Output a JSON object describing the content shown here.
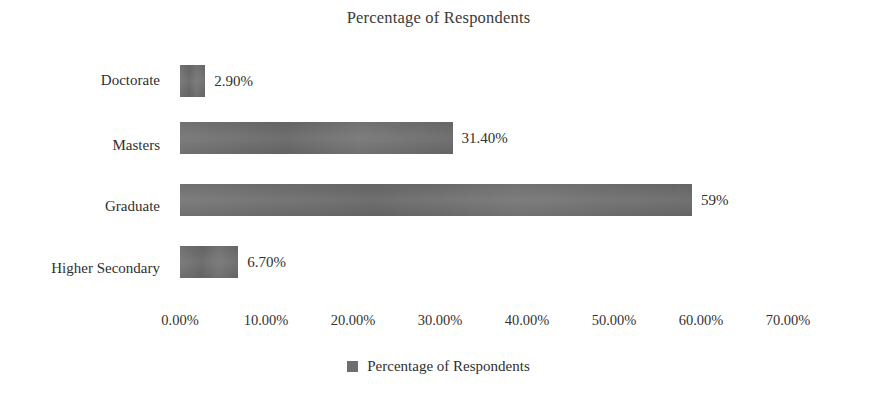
{
  "chart_data": {
    "type": "bar",
    "orientation": "horizontal",
    "title": "Percentage of Respondents",
    "xlabel": "",
    "ylabel": "",
    "categories": [
      "Doctorate",
      "Masters",
      "Graduate",
      "Higher Secondary"
    ],
    "values": [
      2.9,
      31.4,
      59,
      6.7
    ],
    "value_labels": [
      "2.90%",
      "31.40%",
      "59%",
      "6.70%"
    ],
    "series": [
      {
        "name": "Percentage of Respondents",
        "values": [
          2.9,
          31.4,
          59,
          6.7
        ],
        "color": "#6e6e6e"
      }
    ],
    "xlim": [
      0,
      70
    ],
    "xticks": [
      0,
      10,
      20,
      30,
      40,
      50,
      60,
      70
    ],
    "xtick_labels": [
      "0.00%",
      "10.00%",
      "20.00%",
      "30.00%",
      "40.00%",
      "50.00%",
      "60.00%",
      "70.00%"
    ],
    "grid": false,
    "legend": {
      "position": "bottom",
      "entries": [
        {
          "label": "Percentage of Respondents",
          "color": "#6e6e6e",
          "swatch": "legend-swatch-icon"
        }
      ]
    }
  },
  "colors": {
    "bar": "#6e6e6e",
    "background": "#ffffff",
    "text": "#2f2f2f"
  }
}
